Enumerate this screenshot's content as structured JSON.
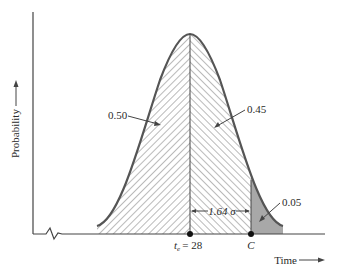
{
  "figure": {
    "type": "normal-distribution-diagram",
    "y_axis_label": "Probability",
    "x_axis_label": "Time",
    "mean_label_prefix": "t",
    "mean_label_sub": "e",
    "mean_label_value": "= 28",
    "critical_label": "C",
    "distance_label": "1.64 σ",
    "areas": [
      {
        "name": "left-half",
        "label": "0.50"
      },
      {
        "name": "center-right",
        "label": "0.45"
      },
      {
        "name": "right-tail",
        "label": "0.05"
      }
    ],
    "colors": {
      "curve": "#555555",
      "axis": "#444444",
      "tail_fill": "#a8a8a8",
      "hatch": "#555555"
    }
  }
}
